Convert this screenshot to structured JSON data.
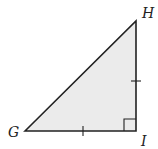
{
  "diagram": {
    "type": "right-triangle",
    "fill_color": "#ebebeb",
    "stroke_color": "#222222",
    "vertices": {
      "G": {
        "label": "G",
        "x": 25,
        "y": 131
      },
      "H": {
        "label": "H",
        "x": 136,
        "y": 21
      },
      "I": {
        "label": "I",
        "x": 136,
        "y": 131
      }
    },
    "right_angle_at": "I",
    "congruent_sides": [
      "GI",
      "HI"
    ],
    "tick_marks": [
      {
        "side": "GI",
        "count": 1
      },
      {
        "side": "HI",
        "count": 1
      }
    ]
  }
}
